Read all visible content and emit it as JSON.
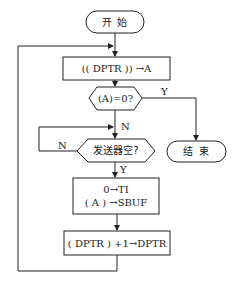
{
  "flowchart": {
    "nodes": {
      "start": {
        "type": "terminal",
        "text": "开 始"
      },
      "load": {
        "type": "process",
        "text": "(( DPTR )) →A"
      },
      "check_zero": {
        "type": "decision",
        "text": "(A)=0?"
      },
      "check_tx": {
        "type": "decision",
        "text": "发送器空?"
      },
      "send": {
        "type": "process",
        "line1": "0→TI",
        "line2": "( A ) →SBUF"
      },
      "inc": {
        "type": "process",
        "text": "( DPTR ) +1→DPTR"
      },
      "end": {
        "type": "terminal",
        "text": "结 束"
      }
    },
    "edge_labels": {
      "zero_yes": "Y",
      "zero_no": "N",
      "tx_no": "N",
      "tx_yes": "Y"
    },
    "colors": {
      "line": "#222222",
      "background": "#ffffff"
    }
  }
}
